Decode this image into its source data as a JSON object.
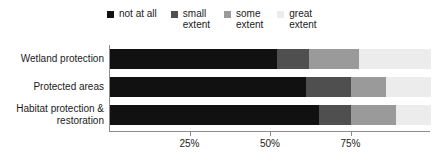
{
  "chart_data": {
    "type": "bar",
    "orientation": "horizontal",
    "stacked": true,
    "stack_mode": "percent",
    "title": "",
    "xlabel": "",
    "ylabel": "",
    "xlim": [
      0,
      100
    ],
    "grid": false,
    "legend_position": "top",
    "xticks": [
      {
        "value": 25,
        "label": "25%"
      },
      {
        "value": 50,
        "label": "50%"
      },
      {
        "value": 75,
        "label": "75%"
      }
    ],
    "categories": [
      "Wetland protection",
      "Protected areas",
      "Habitat protection &\nrestoration"
    ],
    "series": [
      {
        "name": "not at all",
        "color": "#111111",
        "values": [
          52,
          61,
          65
        ]
      },
      {
        "name": "small\nextent",
        "color": "#4f4f4f",
        "values": [
          10,
          14,
          10
        ]
      },
      {
        "name": "some\nextent",
        "color": "#9a9a9a",
        "values": [
          15.5,
          11,
          14
        ]
      },
      {
        "name": "great\nextent",
        "color": "#ececec",
        "values": [
          22.5,
          14,
          11
        ]
      }
    ]
  },
  "legend": {
    "items": [
      {
        "label": "not at all",
        "swatch_color": "#111111"
      },
      {
        "label": "small\nextent",
        "swatch_color": "#4f4f4f"
      },
      {
        "label": "some\nextent",
        "swatch_color": "#9a9a9a"
      },
      {
        "label": "great\nextent",
        "swatch_color": "#ececec"
      }
    ]
  },
  "axis": {
    "line_color": "#8c8c8c"
  }
}
